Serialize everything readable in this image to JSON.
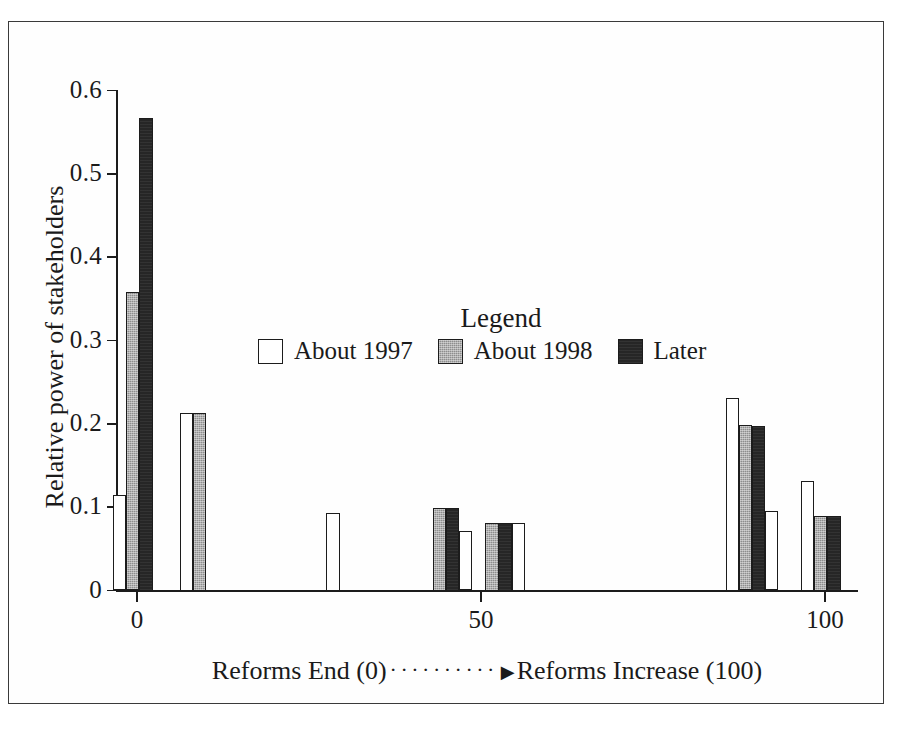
{
  "chart_data": {
    "type": "bar",
    "title": "",
    "xlabel": "Reforms End (0) ·········· ▶ Reforms Increase (100)",
    "ylabel": "Relative power of stakeholders",
    "xlim": [
      -8,
      108
    ],
    "ylim": [
      0,
      0.6
    ],
    "grid": false,
    "legend_position": "inside-top-center",
    "legend_title": "Legend",
    "xticks": [
      0,
      50,
      100
    ],
    "xtick_labels": [
      "0",
      "50",
      "100"
    ],
    "yticks": [
      0,
      0.1,
      0.2,
      0.3,
      0.4,
      0.5,
      0.6
    ],
    "ytick_labels": [
      "0",
      "0.1",
      "0.2",
      "0.3",
      "0.4",
      "0.5",
      "0.6"
    ],
    "series": [
      {
        "name": "About 1997",
        "fill": "white",
        "color": "#ffffff"
      },
      {
        "name": "About 1998",
        "fill": "gray",
        "color": "#8d8d8d"
      },
      {
        "name": "Later",
        "fill": "black",
        "color": "#262626"
      }
    ],
    "bars": [
      {
        "series": "About 1997",
        "x": -2.5,
        "value": 0.115
      },
      {
        "series": "About 1998",
        "x": -0.6,
        "value": 0.358
      },
      {
        "series": "Later",
        "x": 1.3,
        "value": 0.567
      },
      {
        "series": "About 1997",
        "x": 7.2,
        "value": 0.213
      },
      {
        "series": "About 1998",
        "x": 9.1,
        "value": 0.213
      },
      {
        "series": "About 1997",
        "x": 28.5,
        "value": 0.093
      },
      {
        "series": "About 1998",
        "x": 44.0,
        "value": 0.099
      },
      {
        "series": "Later",
        "x": 45.9,
        "value": 0.099
      },
      {
        "series": "About 1997",
        "x": 47.8,
        "value": 0.071
      },
      {
        "series": "About 1998",
        "x": 51.6,
        "value": 0.081
      },
      {
        "series": "Later",
        "x": 53.5,
        "value": 0.081
      },
      {
        "series": "About 1997",
        "x": 55.4,
        "value": 0.081
      },
      {
        "series": "About 1997",
        "x": 86.5,
        "value": 0.231
      },
      {
        "series": "About 1998",
        "x": 88.4,
        "value": 0.199
      },
      {
        "series": "Later",
        "x": 90.3,
        "value": 0.198
      },
      {
        "series": "About 1997",
        "x": 92.2,
        "value": 0.095
      },
      {
        "series": "About 1997",
        "x": 97.5,
        "value": 0.132
      },
      {
        "series": "About 1998",
        "x": 99.4,
        "value": 0.09
      },
      {
        "series": "Later",
        "x": 101.3,
        "value": 0.09
      }
    ]
  },
  "axes": {
    "y_title": "Relative power of stakeholders",
    "x_title_left": "Reforms End (0)",
    "x_title_dots": "··········",
    "x_title_arrow": "▶",
    "x_title_right": "Reforms Increase (100)",
    "y_tick_labels": [
      "0.6",
      "0.5",
      "0.4",
      "0.3",
      "0.2",
      "0.1",
      "0"
    ],
    "x_tick_labels": [
      "0",
      "50",
      "100"
    ]
  },
  "legend": {
    "title": "Legend",
    "entries": [
      {
        "label": "About 1997",
        "swatch": "white-swatch-icon"
      },
      {
        "label": "About 1998",
        "swatch": "gray-swatch-icon"
      },
      {
        "label": "Later",
        "swatch": "black-swatch-icon"
      }
    ]
  },
  "colors": {
    "white_series": "#ffffff",
    "gray_series": "#8d8d8d",
    "black_series": "#262626",
    "axis": "#1c1c1c",
    "frame": "#3a3a3a",
    "background": "#ffffff"
  }
}
